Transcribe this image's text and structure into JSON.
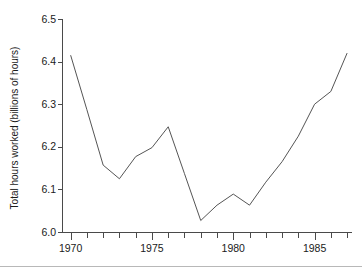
{
  "chart_data": {
    "type": "line",
    "title": "",
    "xlabel": "",
    "ylabel": "Total hours worked (billions of hours)",
    "xlim": [
      1969.5,
      1987.3
    ],
    "ylim": [
      6.0,
      6.5
    ],
    "grid": false,
    "legend": null,
    "x_tick_labels": [
      "1970",
      "1975",
      "1980",
      "1985"
    ],
    "x_tick_values": [
      1970,
      1975,
      1980,
      1985
    ],
    "x_minor_ticks": [
      1971,
      1972,
      1973,
      1974,
      1976,
      1977,
      1978,
      1979,
      1981,
      1982,
      1983,
      1984,
      1986,
      1987
    ],
    "y_tick_labels": [
      "6.0",
      "6.1",
      "6.2",
      "6.3",
      "6.4",
      "6.5"
    ],
    "y_tick_values": [
      6.0,
      6.1,
      6.2,
      6.3,
      6.4,
      6.5
    ],
    "x": [
      1970,
      1971,
      1972,
      1973,
      1974,
      1975,
      1976,
      1977,
      1978,
      1979,
      1980,
      1981,
      1982,
      1983,
      1984,
      1985,
      1986,
      1987
    ],
    "values": [
      6.415,
      6.287,
      6.157,
      6.125,
      6.177,
      6.198,
      6.247,
      6.137,
      6.027,
      6.063,
      6.089,
      6.063,
      6.117,
      6.165,
      6.225,
      6.3,
      6.33,
      6.42
    ],
    "series": [
      {
        "name": "Total hours worked",
        "color": "#555555",
        "values": [
          6.415,
          6.287,
          6.157,
          6.125,
          6.177,
          6.198,
          6.247,
          6.137,
          6.027,
          6.063,
          6.089,
          6.063,
          6.117,
          6.165,
          6.225,
          6.3,
          6.33,
          6.42
        ]
      }
    ]
  },
  "colors": {
    "line": "#555555",
    "axis": "#4a4a4a",
    "text": "#1a1a1a",
    "background": "#ffffff",
    "rule": "#b8b8b8"
  }
}
